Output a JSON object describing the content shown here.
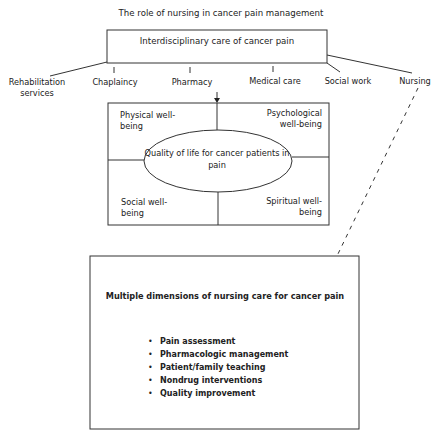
{
  "title": "The role of nursing in cancer pain management",
  "top_box": {
    "label": "Interdisciplinary care of cancer pain"
  },
  "disciplines": [
    {
      "label": "Rehabilitation services"
    },
    {
      "label": "Chaplaincy"
    },
    {
      "label": "Pharmacy"
    },
    {
      "label": "Medical care"
    },
    {
      "label": "Social work"
    },
    {
      "label": "Nursing"
    }
  ],
  "quality_box": {
    "center": "Quality of life for cancer patients in pain",
    "quadrants": {
      "top_left": "Physical well-being",
      "top_right": "Psychological well-being",
      "bottom_left": "Social well-being",
      "bottom_right": "Spiritual well-being"
    }
  },
  "nursing_box": {
    "title": "Multiple dimensions of nursing care for cancer pain",
    "items": [
      "Pain assessment",
      "Pharmacologic management",
      "Patient/family teaching",
      "Nondrug interventions",
      "Quality improvement"
    ]
  }
}
